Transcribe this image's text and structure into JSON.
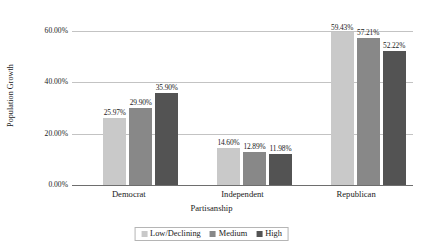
{
  "chart_data": {
    "type": "bar",
    "title": "",
    "xlabel": "Partisanship",
    "ylabel": "Population Growth",
    "categories": [
      "Democrat",
      "Independent",
      "Republican"
    ],
    "series": [
      {
        "name": "Low/Declining",
        "color": "#c9c9c9",
        "values": [
          25.97,
          14.6,
          59.43
        ],
        "labels": [
          "25.97%",
          "14.60%",
          "59.43%"
        ]
      },
      {
        "name": "Medium",
        "color": "#888888",
        "values": [
          29.9,
          12.89,
          57.21
        ],
        "labels": [
          "29.90%",
          "12.89%",
          "57.21%"
        ]
      },
      {
        "name": "High",
        "color": "#535353",
        "values": [
          35.9,
          11.98,
          52.22
        ],
        "labels": [
          "35.90%",
          "11.98%",
          "52.22%"
        ]
      }
    ],
    "ylim": [
      0,
      60
    ],
    "yticks": [
      0,
      20,
      40,
      60
    ],
    "ytick_labels": [
      "0.00%",
      "20.00%",
      "40.00%",
      "60.00%"
    ],
    "grid": true,
    "legend_position": "bottom"
  },
  "legend": {
    "items": [
      {
        "label": "Low/Declining",
        "color": "#c9c9c9"
      },
      {
        "label": "Medium",
        "color": "#888888"
      },
      {
        "label": "High",
        "color": "#535353"
      }
    ]
  }
}
